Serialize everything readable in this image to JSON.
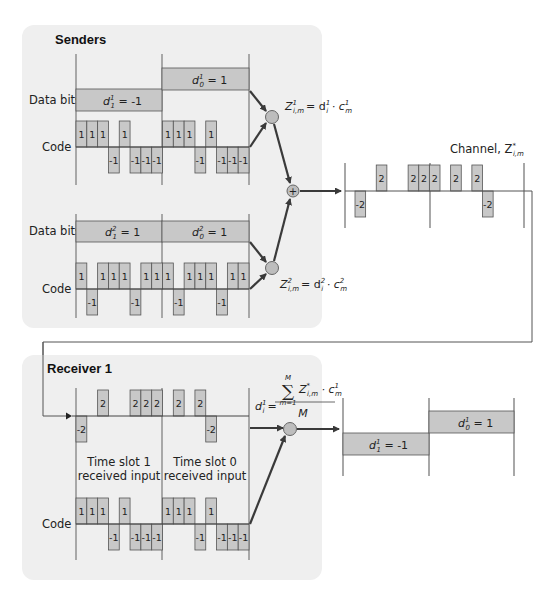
{
  "senders": {
    "title": "Senders",
    "sender1": {
      "data_bits_label": "Data bits",
      "code_label": "Code",
      "bits": [
        {
          "label_main": "d",
          "sup": "1",
          "sub": "1",
          "rest": " = -1",
          "value": -1
        },
        {
          "label_main": "d",
          "sup": "1",
          "sub": "0",
          "rest": " = 1",
          "value": 1
        }
      ],
      "code": [
        1,
        1,
        1,
        -1,
        1,
        -1,
        -1,
        -1
      ],
      "product_eq": {
        "lhs": "Z",
        "lhs_sup": "1",
        "lhs_sub": "i,m",
        "rhs": "= d",
        "rhs_sup": "1",
        "rhs_sub": "i",
        "dot": " · c",
        "c_sup": "1",
        "c_sub": "m"
      }
    },
    "sender2": {
      "data_bits_label": "Data bits",
      "code_label": "Code",
      "bits": [
        {
          "label_main": "d",
          "sup": "2",
          "sub": "1",
          "rest": " = 1",
          "value": 1
        },
        {
          "label_main": "d",
          "sup": "2",
          "sub": "0",
          "rest": " = 1",
          "value": 1
        }
      ],
      "code": [
        1,
        -1,
        1,
        1,
        1,
        -1,
        1,
        1
      ],
      "product_eq": {
        "lhs": "Z",
        "lhs_sup": "2",
        "lhs_sub": "i,m",
        "rhs": "= d",
        "rhs_sup": "2",
        "rhs_sub": "i",
        "dot": " · c",
        "c_sup": "2",
        "c_sub": "m"
      }
    },
    "adder_symbol": "+"
  },
  "channel": {
    "label": "Channel, Z",
    "label_sup": "*",
    "label_sub": "i,m",
    "signal": [
      -2,
      0,
      2,
      0,
      0,
      2,
      2,
      2,
      0,
      2,
      0,
      2,
      -2,
      0,
      0,
      0
    ],
    "signal_labels": [
      "-2",
      "",
      "2",
      "",
      "",
      "2",
      "2",
      "2",
      "",
      "2",
      "",
      "2",
      "-2",
      "",
      "",
      ""
    ]
  },
  "receiver": {
    "title": "Receiver 1",
    "code_label": "Code",
    "slot1_label_line1": "Time slot 1",
    "slot1_label_line2": "received input",
    "slot0_label_line1": "Time slot 0",
    "slot0_label_line2": "received input",
    "input": [
      -2,
      0,
      2,
      0,
      0,
      2,
      2,
      2,
      0,
      2,
      0,
      2,
      -2,
      0,
      0,
      0
    ],
    "code": [
      1,
      1,
      1,
      -1,
      1,
      -1,
      -1,
      -1
    ],
    "decode_eq": {
      "lhs": "d",
      "lhs_sup": "1",
      "lhs_sub": "i",
      "equals": "=",
      "sum_symbol": "∑",
      "sum_top": "M",
      "sum_bottom": "m=1",
      "numerator": "Z",
      "num_sup": "*",
      "num_sub": "i,m",
      "dot": " · c",
      "c_sup": "1",
      "c_sub": "m",
      "denominator": "M"
    },
    "outputs": [
      {
        "label_main": "d",
        "sup": "1",
        "sub": "1",
        "rest": " = -1",
        "value": -1
      },
      {
        "label_main": "d",
        "sup": "1",
        "sub": "0",
        "rest": " = 1",
        "value": 1
      }
    ]
  },
  "colors": {
    "panel": "#efefef",
    "box": "#c8c8c8",
    "guide": "#a8a8a8",
    "arrow": "#3a3a3a"
  }
}
